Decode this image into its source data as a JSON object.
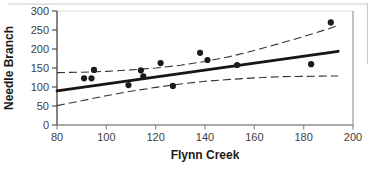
{
  "figure": {
    "type_note": "scanned statistical figure",
    "xlabel": "Flynn Creek",
    "ylabel": "Needle Branch"
  },
  "chart_data": {
    "type": "scatter",
    "title": "",
    "xlabel": "Flynn Creek",
    "ylabel": "Needle Branch",
    "xlim": [
      80,
      200
    ],
    "ylim": [
      0,
      300
    ],
    "xticks": [
      80,
      100,
      120,
      140,
      160,
      180,
      200
    ],
    "yticks": [
      0,
      50,
      100,
      150,
      200,
      250,
      300
    ],
    "grid": false,
    "legend_position": "none",
    "series": [
      {
        "name": "observations",
        "marker": "filled-circle",
        "points": [
          [
            91,
            123
          ],
          [
            94,
            123
          ],
          [
            95,
            145
          ],
          [
            109,
            105
          ],
          [
            114,
            144
          ],
          [
            115,
            128
          ],
          [
            122,
            163
          ],
          [
            127,
            103
          ],
          [
            138,
            190
          ],
          [
            141,
            171
          ],
          [
            153,
            158
          ],
          [
            183,
            160
          ],
          [
            191,
            270
          ]
        ]
      }
    ],
    "regression_line": {
      "x": [
        80,
        194
      ],
      "y": [
        90,
        194
      ],
      "style": "solid-thick"
    },
    "confidence_band_upper": {
      "style": "dashed",
      "points": [
        [
          80,
          138
        ],
        [
          90,
          139
        ],
        [
          100,
          141
        ],
        [
          110,
          145
        ],
        [
          120,
          150
        ],
        [
          130,
          157
        ],
        [
          140,
          167
        ],
        [
          150,
          180
        ],
        [
          160,
          196
        ],
        [
          170,
          214
        ],
        [
          180,
          233
        ],
        [
          190,
          253
        ],
        [
          194,
          262
        ]
      ]
    },
    "confidence_band_lower": {
      "style": "dashed",
      "points": [
        [
          80,
          51
        ],
        [
          90,
          64
        ],
        [
          100,
          77
        ],
        [
          110,
          89
        ],
        [
          120,
          99
        ],
        [
          130,
          108
        ],
        [
          140,
          115
        ],
        [
          150,
          120
        ],
        [
          160,
          124
        ],
        [
          170,
          127
        ],
        [
          180,
          128
        ],
        [
          190,
          129
        ],
        [
          194,
          129
        ]
      ]
    },
    "colors": {
      "point": "#1c1c1c",
      "regression_line": "#161616",
      "band_line": "#333333",
      "y_axis": "#4f4f4f",
      "x_axis": "#8c8c8c",
      "right_frame": "#9a9a9a",
      "top_frame": "#d8d8d8",
      "tick_text": "#3d3d3d",
      "label_text": "#1a1a1a",
      "page_border": "#c9c9c9"
    }
  }
}
